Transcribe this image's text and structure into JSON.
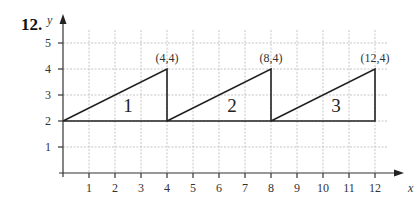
{
  "problem_number": "12.",
  "chart_data": {
    "type": "line",
    "title": "",
    "xlabel": "x",
    "ylabel": "y",
    "xlim": [
      0,
      12.5
    ],
    "ylim": [
      0,
      5.5
    ],
    "grid": true,
    "x_ticks": [
      "1",
      "2",
      "3",
      "4",
      "5",
      "6",
      "7",
      "8",
      "9",
      "10",
      "11",
      "12"
    ],
    "y_ticks": [
      "1",
      "2",
      "3",
      "4",
      "5"
    ],
    "series": [
      {
        "name": "triangle-1",
        "points": [
          [
            0,
            2
          ],
          [
            4,
            4
          ],
          [
            4,
            2
          ],
          [
            0,
            2
          ]
        ]
      },
      {
        "name": "triangle-2",
        "points": [
          [
            4,
            2
          ],
          [
            8,
            4
          ],
          [
            8,
            2
          ],
          [
            4,
            2
          ]
        ]
      },
      {
        "name": "triangle-3",
        "points": [
          [
            8,
            2
          ],
          [
            12,
            4
          ],
          [
            12,
            2
          ],
          [
            8,
            2
          ]
        ]
      }
    ],
    "annotations": [
      {
        "text": "(4,4)",
        "x": 4,
        "y": 4
      },
      {
        "text": "(8,4)",
        "x": 8,
        "y": 4
      },
      {
        "text": "(12,4)",
        "x": 12,
        "y": 4
      },
      {
        "text": "1",
        "x": 2.5,
        "y": 2.6
      },
      {
        "text": "2",
        "x": 6.5,
        "y": 2.6
      },
      {
        "text": "3",
        "x": 10.5,
        "y": 2.6
      }
    ]
  }
}
